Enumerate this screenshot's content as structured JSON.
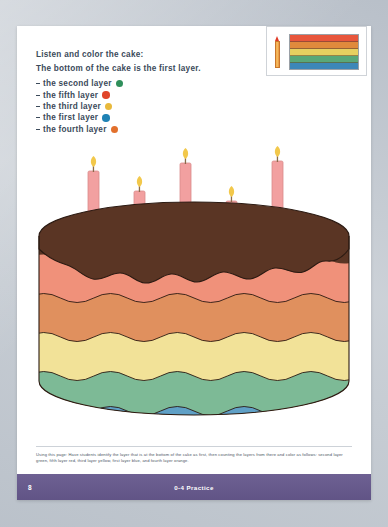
{
  "worksheet": {
    "lead_line_1": "Listen and color the cake:",
    "lead_line_2": "The bottom of the cake is the first layer.",
    "layer_list": [
      {
        "label": "the second layer",
        "color": "#2f8f5b"
      },
      {
        "label": "the fifth layer",
        "color": "#e0452a"
      },
      {
        "label": "the third layer",
        "color": "#e8b93c"
      },
      {
        "label": "the first layer",
        "color": "#1f82b5"
      },
      {
        "label": "the fourth layer",
        "color": "#e2702c"
      }
    ],
    "footnote": "Using this page: Have students identify the layer that is at the bottom of the cake as first, then counting the layers from there and color as follows: second layer green, fifth layer red, third layer yellow, first layer blue, and fourth layer orange.",
    "page_number": "8",
    "footer_title": "0-4 Practice",
    "footer_color": "#665889"
  },
  "thumbnail": {
    "crayon_color": "#e03a26",
    "mini_bars": [
      "#e8563c",
      "#e08a3c",
      "#e8d060",
      "#5aa878",
      "#3d87b8"
    ]
  },
  "cake": {
    "frosting_color": "#5a3524",
    "outline_color": "#2b1a12",
    "layers": [
      {
        "name": "salmon-layer",
        "color": "#f0917a"
      },
      {
        "name": "orange-layer",
        "color": "#e0905e"
      },
      {
        "name": "yellow-layer",
        "color": "#f2e298"
      },
      {
        "name": "green-layer",
        "color": "#7dba96"
      },
      {
        "name": "blue-layer",
        "color": "#5fa0c6"
      }
    ],
    "candle_color": "#f2a0a0",
    "candle_edge": "#d98c8c",
    "flame_color": "#f2c84b",
    "candle_count": 5
  }
}
